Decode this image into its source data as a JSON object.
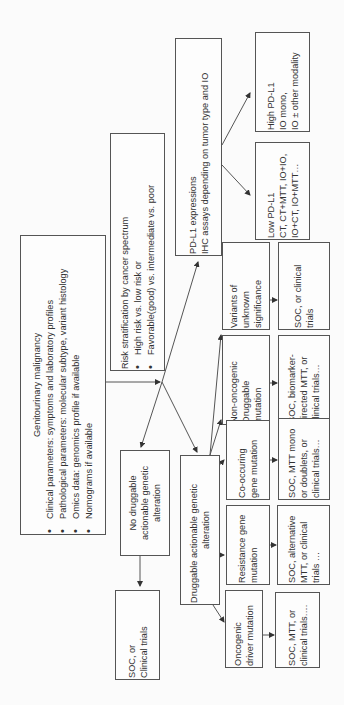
{
  "diagram": {
    "orientation": "rotated-90-ccw",
    "root": {
      "title": "Genitourinary malignancy",
      "bullets": [
        "Clinical parameters: symptoms and laboratory profiles",
        "Pathological parameters: molecular subtype, variant histology",
        "Omics data: genomics profile if available",
        "Nomograms if available"
      ]
    },
    "risk": {
      "title": "Risk stratification by cancer spectrum",
      "bullets": [
        "High risk vs. low risk or",
        "Favorable(good) vs. intermediate vs. poor"
      ]
    },
    "pdl1": {
      "lines": [
        "PD-L1 expressions",
        "IHC assays depending on tumor type and IO"
      ]
    },
    "low_pdl1": {
      "lines": [
        "Low PD-L1",
        "CT, CT+MTT, IO+IO,",
        "IO+CT, IO+MTT…"
      ]
    },
    "high_pdl1": {
      "lines": [
        "High PD-L1",
        "IO mono,",
        "IO ± other modality"
      ]
    },
    "no_druggable": {
      "lines": [
        "No druggable",
        "actionable genetic",
        "alteration"
      ]
    },
    "no_druggable_outcome": {
      "lines": [
        "SOC, or",
        "Clinical trials"
      ]
    },
    "druggable": {
      "lines": [
        "Druggable actionable genetic",
        "alteration"
      ]
    },
    "branches": [
      {
        "name": "vus",
        "lines": [
          "Variants of",
          "unknown",
          "significance"
        ],
        "outcome": [
          "SOC, or clinical",
          "trials"
        ]
      },
      {
        "name": "non-oncogenic",
        "lines": [
          "Non-oncogenic",
          "Druggable",
          "mutation"
        ],
        "outcome": [
          "SOC, biomarker-",
          "directed MTT, or",
          "clinical trials…"
        ]
      },
      {
        "name": "co-occuring",
        "lines": [
          "Co-occuring",
          "gene mutation"
        ],
        "outcome": [
          "SOC, MTT mono",
          "or doublets, or",
          "clinical trials…"
        ]
      },
      {
        "name": "resistance",
        "lines": [
          "Resistance gene",
          "mutation"
        ],
        "outcome": [
          "SOC, alternative",
          "MTT, or clinical",
          "trials …"
        ]
      },
      {
        "name": "oncogenic",
        "lines": [
          "Oncogenic",
          "driver mutation"
        ],
        "outcome": [
          "SOC, MTT, or",
          "clinical trials…."
        ]
      }
    ],
    "colors": {
      "line": "#555555",
      "text": "#333333",
      "background": "#fbfbfb"
    }
  }
}
